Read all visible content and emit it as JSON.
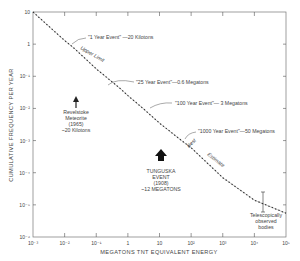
{
  "chart_data": {
    "type": "line",
    "title": "",
    "xlabel": "MEGATONS  TNT  EQUIVALENT  ENERGY",
    "ylabel": "CUMULATIVE  FREQUENCY  PER  YEAR",
    "xscale": "log",
    "yscale": "log",
    "xlim": [
      0.001,
      100000
    ],
    "ylim": [
      1e-06,
      10
    ],
    "grid": false,
    "x_ticks": [
      "10⁻³",
      "10⁻²",
      "10⁻¹",
      "1",
      "10",
      "10²",
      "10³",
      "10⁴",
      "10⁵"
    ],
    "y_ticks": [
      "10",
      "1",
      "10⁻¹",
      "10⁻²",
      "10⁻³",
      "10⁻⁴",
      "10⁻⁵",
      "10⁻⁶"
    ],
    "series": [
      {
        "name": "Cumulative frequency (dotted curve)",
        "style": "dotted",
        "x": [
          0.001,
          0.01,
          0.02,
          0.1,
          0.6,
          1,
          3,
          10,
          50,
          100,
          1000,
          10000,
          100000
        ],
        "y": [
          10,
          1.3,
          0.75,
          0.17,
          0.04,
          0.025,
          0.01,
          0.0035,
          0.001,
          0.0006,
          7e-05,
          1.4e-05,
          5.5e-06
        ]
      }
    ],
    "annotations": [
      {
        "text": "\"1 Year Event\" —20 Kilotons",
        "x": 0.02,
        "y": 1
      },
      {
        "text": "Upper Limit",
        "style": "italic",
        "along_curve": true
      },
      {
        "text": "\"25 Year Event\"—0.6 Megatons",
        "x": 0.6,
        "y": 0.04
      },
      {
        "text": "\"100 Year Event\"— 3 Megatons",
        "x": 3,
        "y": 0.01
      },
      {
        "text": "\"1000 Year Event\"—50 Megatons",
        "x": 50,
        "y": 0.001
      },
      {
        "text": "Best Estimate",
        "style": "italic",
        "along_curve": true
      },
      {
        "text": "Revelstoke Meteorite (1965) ~20 Kilotons",
        "marker": "up-arrow",
        "x": 0.02
      },
      {
        "text": "TUNGUSKA EVENT (1908) ~12 MEGATONS",
        "marker": "up-arrow-bold",
        "x": 12
      },
      {
        "text": "Telescopically observed bodies",
        "marker": "error-bar",
        "x": 10000
      }
    ]
  },
  "labels": {
    "xlabel": "MEGATONS  TNT  EQUIVALENT  ENERGY",
    "ylabel": "CUMULATIVE  FREQUENCY  PER  YEAR",
    "ann_1yr": "\"1 Year Event\"  —20 Kilotons",
    "ann_upper": "Upper Limit",
    "ann_25yr": "\"25 Year Event\"—0.6 Megatons",
    "ann_100yr": "\"100 Year Event\"— 3 Megatons",
    "ann_1000yr": "\"1000 Year Event\"—50 Megatons",
    "ann_best": "Best",
    "ann_estimate": "Estimate",
    "revelstoke": [
      "Revelstoke",
      "Meteorite",
      "(1965)",
      "~20 Kilotons"
    ],
    "tunguska": [
      "TUNGUSKA",
      "EVENT",
      "(1908)",
      "~12 MEGATONS"
    ],
    "telescopic": [
      "Telescopically",
      "observed",
      "bodies"
    ]
  }
}
